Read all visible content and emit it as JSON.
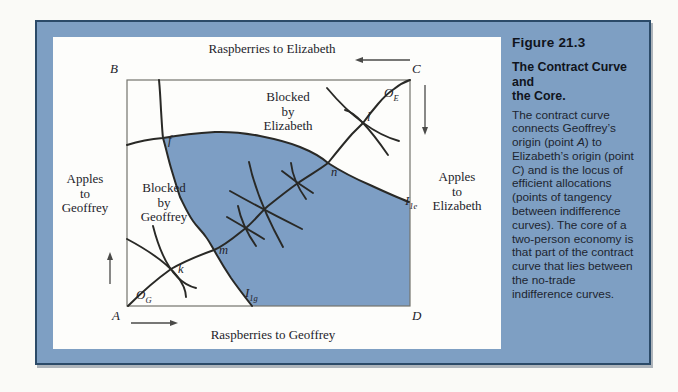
{
  "figure": {
    "label": "Figure 21.3",
    "title": "The Contract Curve and\nthe Core.",
    "body_1": "The contract curve\nconnects Geoffrey’s\norigin (point ",
    "body_italic_1": "A",
    "body_2": ") to\nElizabeth’s origin (point\n",
    "body_italic_2": "C",
    "body_3": ") and is the locus of\nefficient allocations\n(points of tangency\nbetween indifference\ncurves). The core of a\ntwo-person economy is\nthat part of the contract\ncurve that lies between\nthe no-trade\nindifference curves."
  },
  "diagram": {
    "axis_labels": {
      "top": "Raspberries to Elizabeth",
      "bottom": "Raspberries to Geoffrey",
      "left": "Apples\nto\nGeoffrey",
      "right": "Apples\nto\nElizabeth"
    },
    "corners": {
      "top_left": "B",
      "top_right": "C",
      "bottom_left": "A",
      "bottom_right": "D"
    },
    "origins": {
      "geoffrey": {
        "main": "O",
        "sub": "G"
      },
      "elizabeth": {
        "main": "O",
        "sub": "E"
      }
    },
    "points": {
      "f": "f",
      "k": "k",
      "m": "m",
      "n": "n",
      "l": "l"
    },
    "curve_labels": {
      "geoffrey_no_trade": {
        "main": "I",
        "sub": "1g"
      },
      "elizabeth_no_trade": {
        "main": "I",
        "sub": "1e"
      }
    },
    "regions": {
      "blocked_by_elizabeth": "Blocked\nby\nElizabeth",
      "blocked_by_geoffrey": "Blocked\nby\nGeoffrey"
    }
  },
  "colors": {
    "page_bg": "#fafaf7",
    "frame_blue": "#7e9fc3",
    "frame_border": "#2b4a68",
    "panel_bg": "#fdfdfb",
    "lens_blue": "#7d9ec4",
    "curve_color": "#292926",
    "box_edge": "#74746d",
    "arrow_color": "#4a4a48",
    "diagram_text": "#23232a",
    "caption_text": "#1d2530",
    "caption_heading": "#10141c"
  }
}
